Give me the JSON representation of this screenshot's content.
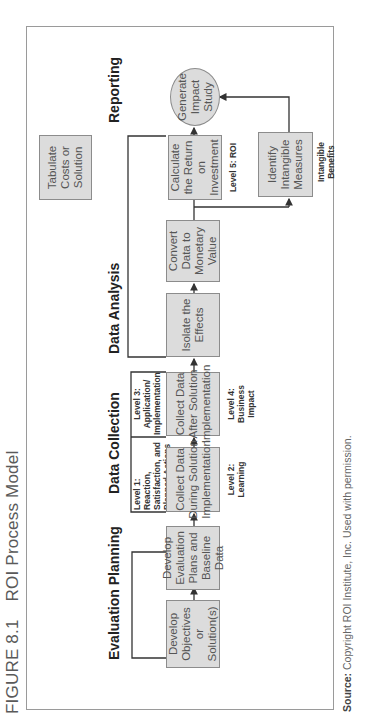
{
  "figure": {
    "number": "FIGURE 8.1",
    "title": "ROI Process Model"
  },
  "phases": {
    "evaluation_planning": "Evaluation Planning",
    "data_collection": "Data Collection",
    "data_analysis": "Data Analysis",
    "reporting": "Reporting"
  },
  "boxes": {
    "develop_objectives": "Develop Objectives or Solution(s)",
    "develop_plans": "Develop Evaluation Plans and Baseline Data",
    "collect_during": "Collect Data During Solution Implementation",
    "collect_after": "Collect Data After Solution Implementation",
    "isolate": "Isolate the Effects",
    "convert": "Convert Data to Monetary Value",
    "calculate_roi": "Calculate the Return on Investment",
    "generate_study": "Generate Impact Study",
    "tabulate_costs": "Tabulate Costs or Solution",
    "identify_intangible": "Identify Intangible Measures"
  },
  "levels": {
    "level1": "Level 1: Reaction, Satisfaction, and Planned Actions",
    "level2": "Level 2: Learning",
    "level3": "Level 3: Application/ Implementation",
    "level4": "Level 4: Business Impact",
    "level5": "Level 5: ROI",
    "intangible": "Intangible Benefits"
  },
  "source": {
    "label": "Source:",
    "text": "Copyright ROI Institute, Inc. Used with permission."
  },
  "colors": {
    "box_fill": "#dcdcdc",
    "box_border": "#8c8c8c",
    "line": "#333333",
    "frame": "#9a9a9a"
  }
}
